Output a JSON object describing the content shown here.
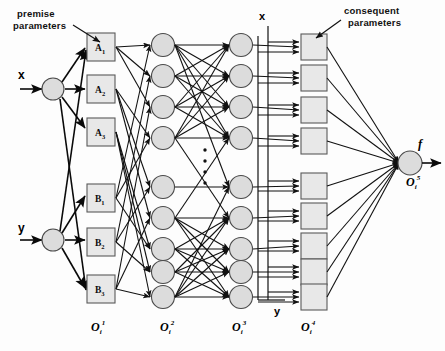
{
  "figure": {
    "annotations": [
      {
        "id": "premise",
        "line1": "premise",
        "line2": "parameters"
      },
      {
        "id": "consequent",
        "line1": "consequent",
        "line2": "parameters"
      }
    ],
    "inputs": [
      {
        "id": "input-x",
        "label": "x"
      },
      {
        "id": "input-y",
        "label": "y"
      }
    ],
    "bus_labels": [
      {
        "id": "bus-x",
        "label": "x"
      },
      {
        "id": "bus-y",
        "label": "y"
      }
    ],
    "output": {
      "signal_label": "f",
      "node_label": "O",
      "node_sub": "i",
      "node_sup": "5"
    },
    "membership_nodes": [
      {
        "base": "A",
        "sub": "1"
      },
      {
        "base": "A",
        "sub": "2"
      },
      {
        "base": "A",
        "sub": "3"
      },
      {
        "base": "B",
        "sub": "1"
      },
      {
        "base": "B",
        "sub": "2"
      },
      {
        "base": "B",
        "sub": "3"
      }
    ],
    "layer_labels": [
      {
        "base": "O",
        "sub": "i",
        "sup": "1"
      },
      {
        "base": "O",
        "sub": "i",
        "sup": "2"
      },
      {
        "base": "O",
        "sub": "i",
        "sup": "3"
      },
      {
        "base": "O",
        "sub": "i",
        "sup": "4"
      }
    ],
    "layer2_node_count": 9,
    "layer3_node_count": 9,
    "layer4_node_count": 9,
    "ellipsis_dots": 4,
    "colors": {
      "node_fill": "#dcdcdc",
      "square_fill": "#e8e8e8",
      "stroke": "#111111",
      "background": "#ffffff"
    }
  }
}
